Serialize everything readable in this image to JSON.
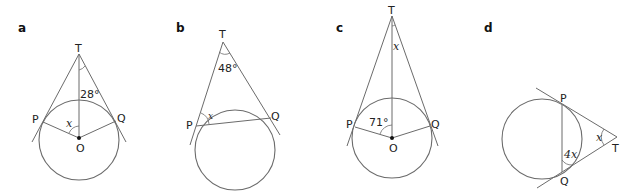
{
  "diagrams": [
    {
      "label": "a",
      "points": {
        "T": "T",
        "P": "P",
        "Q": "Q",
        "O": "O"
      },
      "angle_given": "28°",
      "angle_unknown": "x"
    },
    {
      "label": "b",
      "points": {
        "T": "T",
        "P": "P",
        "Q": "Q"
      },
      "angle_given": "48°",
      "angle_unknown": "x"
    },
    {
      "label": "c",
      "points": {
        "T": "T",
        "P": "P",
        "Q": "Q",
        "O": "O"
      },
      "angle_given": "71°",
      "angle_unknown": "x"
    },
    {
      "label": "d",
      "points": {
        "T": "T",
        "P": "P",
        "Q": "Q"
      },
      "angle_given": "4x",
      "angle_unknown": "x"
    }
  ],
  "colors": {
    "stroke": "#6b6b6b",
    "text": "#222222"
  }
}
